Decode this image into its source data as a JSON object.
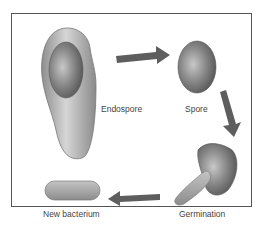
{
  "stages": [
    {
      "id": "endospore",
      "label": "Endospore"
    },
    {
      "id": "spore",
      "label": "Spore"
    },
    {
      "id": "germination",
      "label": "Germination"
    },
    {
      "id": "new-bacterium",
      "label": "New bacterium"
    }
  ],
  "colors": {
    "cell_fill": "#a8a8a8",
    "spore_fill": "#7a7a7a",
    "arrow": "#5e5e5e",
    "border": "#555555",
    "text": "#444444"
  }
}
